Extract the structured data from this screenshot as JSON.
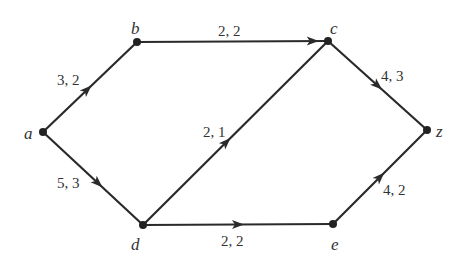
{
  "diagram": {
    "type": "flow-network",
    "nodes": [
      {
        "id": "a",
        "label": "a",
        "x": 43,
        "y": 132,
        "lx": 24,
        "ly": 125
      },
      {
        "id": "b",
        "label": "b",
        "x": 137,
        "y": 42,
        "lx": 131,
        "ly": 20
      },
      {
        "id": "c",
        "label": "c",
        "x": 328,
        "y": 41,
        "lx": 330,
        "ly": 20
      },
      {
        "id": "z",
        "label": "z",
        "x": 427,
        "y": 130,
        "lx": 436,
        "ly": 123
      },
      {
        "id": "d",
        "label": "d",
        "x": 143,
        "y": 225,
        "lx": 131,
        "ly": 236
      },
      {
        "id": "e",
        "label": "e",
        "x": 333,
        "y": 224,
        "lx": 331,
        "ly": 236
      }
    ],
    "edges": [
      {
        "from": "a",
        "to": "b",
        "label": "3, 2",
        "capacity": 3,
        "flow": 2,
        "arrow_t": 0.47,
        "lx": 57,
        "ly": 73
      },
      {
        "from": "a",
        "to": "d",
        "label": "5, 3",
        "capacity": 5,
        "flow": 3,
        "arrow_t": 0.55,
        "lx": 57,
        "ly": 176
      },
      {
        "from": "b",
        "to": "c",
        "label": "2, 2",
        "capacity": 2,
        "flow": 2,
        "arrow_t": 0.92,
        "lx": 218,
        "ly": 24
      },
      {
        "from": "d",
        "to": "c",
        "label": "2, 1",
        "capacity": 2,
        "flow": 1,
        "arrow_t": 0.45,
        "lx": 203,
        "ly": 125
      },
      {
        "from": "d",
        "to": "e",
        "label": "2, 2",
        "capacity": 2,
        "flow": 2,
        "arrow_t": 0.5,
        "lx": 221,
        "ly": 234
      },
      {
        "from": "c",
        "to": "z",
        "label": "4, 3",
        "capacity": 4,
        "flow": 3,
        "arrow_t": 0.5,
        "lx": 381,
        "ly": 69
      },
      {
        "from": "e",
        "to": "z",
        "label": "4, 2",
        "capacity": 4,
        "flow": 2,
        "arrow_t": 0.5,
        "lx": 383,
        "ly": 183
      }
    ]
  }
}
